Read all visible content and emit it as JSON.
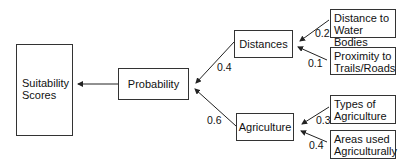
{
  "nodes": {
    "suitability": {
      "line1": "Suitability",
      "line2": "Scores"
    },
    "probability": {
      "label": "Probability"
    },
    "distances": {
      "label": "Distances"
    },
    "agriculture": {
      "label": "Agriculture"
    },
    "water": {
      "line1": "Distance to",
      "line2": "Water Bodies"
    },
    "trails": {
      "line1": "Proximity to",
      "line2": "Trails/Roads"
    },
    "types": {
      "line1": "Types of",
      "line2": "Agriculture"
    },
    "areas": {
      "line1": "Areas used",
      "line2": "Agriculturally"
    }
  },
  "weights": {
    "distances_to_probability": "0.4",
    "agriculture_to_probability": "0.6",
    "water_to_distances": "0.2",
    "trails_to_distances": "0.1",
    "types_to_agriculture": "0.3",
    "areas_to_agriculture": "0.4"
  },
  "colors": {
    "line": "#222222",
    "border": "#333333",
    "background": "#ffffff"
  }
}
